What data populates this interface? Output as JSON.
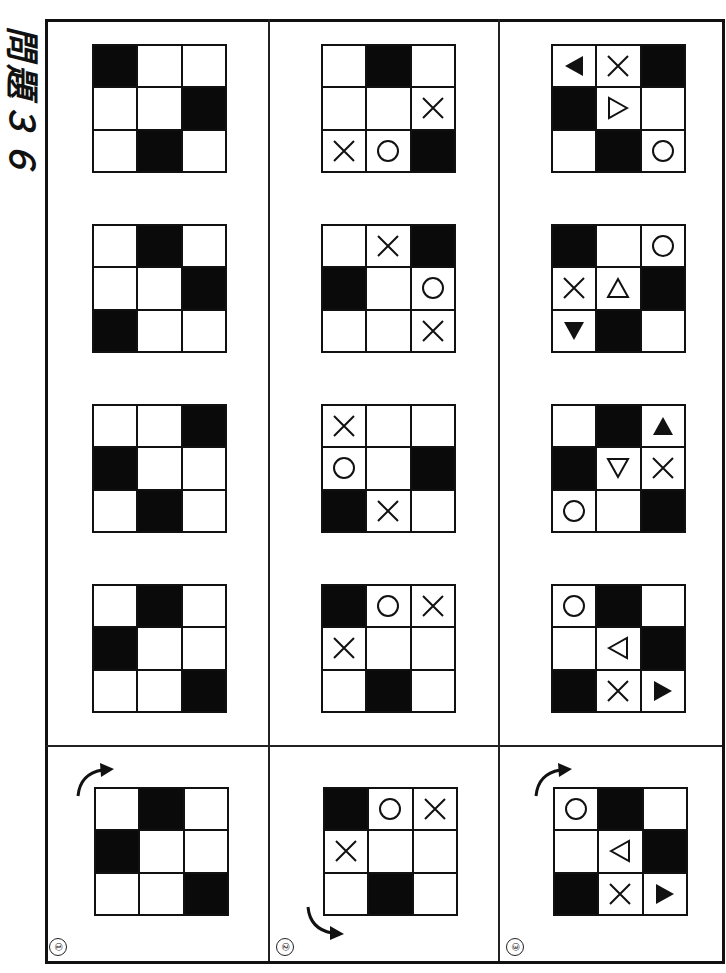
{
  "title": "問題３６",
  "colors": {
    "ink": "#111111",
    "paper": "#ffffff"
  },
  "columns": [
    {
      "label": "①",
      "reference": {
        "rotation_arrow": "clockwise-arrow",
        "cells": [
          "white",
          "black",
          "white",
          "black",
          "white",
          "white",
          "white",
          "white",
          "black"
        ],
        "symbols": [
          "",
          "",
          "",
          "",
          "",
          "",
          "",
          "",
          ""
        ]
      },
      "options": [
        {
          "cells": [
            "black",
            "white",
            "white",
            "white",
            "white",
            "black",
            "white",
            "black",
            "white"
          ],
          "symbols": [
            "",
            "",
            "",
            "",
            "",
            "",
            "",
            "",
            ""
          ]
        },
        {
          "cells": [
            "white",
            "black",
            "white",
            "white",
            "white",
            "black",
            "black",
            "white",
            "white"
          ],
          "symbols": [
            "",
            "",
            "",
            "",
            "",
            "",
            "",
            "",
            ""
          ]
        },
        {
          "cells": [
            "white",
            "white",
            "black",
            "black",
            "white",
            "white",
            "white",
            "black",
            "white"
          ],
          "symbols": [
            "",
            "",
            "",
            "",
            "",
            "",
            "",
            "",
            ""
          ]
        },
        {
          "cells": [
            "white",
            "black",
            "white",
            "black",
            "white",
            "white",
            "white",
            "white",
            "black"
          ],
          "symbols": [
            "",
            "",
            "",
            "",
            "",
            "",
            "",
            "",
            ""
          ]
        }
      ]
    },
    {
      "label": "②",
      "reference": {
        "rotation_arrow": "counterclockwise-arrow",
        "cells": [
          "black",
          "white",
          "white",
          "white",
          "white",
          "white",
          "white",
          "black",
          "white"
        ],
        "symbols": [
          "",
          "circle",
          "cross",
          "cross",
          "",
          "",
          "",
          "",
          ""
        ]
      },
      "options": [
        {
          "cells": [
            "white",
            "black",
            "white",
            "white",
            "white",
            "white",
            "white",
            "white",
            "black"
          ],
          "symbols": [
            "",
            "",
            "",
            "",
            "",
            "cross",
            "cross",
            "circle",
            ""
          ]
        },
        {
          "cells": [
            "white",
            "white",
            "black",
            "black",
            "white",
            "white",
            "white",
            "white",
            "white"
          ],
          "symbols": [
            "",
            "cross",
            "",
            "",
            "",
            "circle",
            "",
            "",
            "cross"
          ]
        },
        {
          "cells": [
            "white",
            "white",
            "white",
            "white",
            "white",
            "black",
            "black",
            "white",
            "white"
          ],
          "symbols": [
            "cross",
            "",
            "",
            "circle",
            "",
            "",
            "",
            "cross",
            ""
          ]
        },
        {
          "cells": [
            "black",
            "white",
            "white",
            "white",
            "white",
            "white",
            "white",
            "black",
            "white"
          ],
          "symbols": [
            "",
            "circle",
            "cross",
            "cross",
            "",
            "",
            "",
            "",
            ""
          ]
        }
      ]
    },
    {
      "label": "③",
      "reference": {
        "rotation_arrow": "clockwise-arrow",
        "cells": [
          "white",
          "black",
          "white",
          "white",
          "white",
          "black",
          "black",
          "white",
          "white"
        ],
        "symbols": [
          "circle",
          "",
          "",
          "",
          "triangle-left-outline",
          "",
          "",
          "cross",
          "triangle-right-filled"
        ]
      },
      "options": [
        {
          "cells": [
            "white",
            "white",
            "black",
            "black",
            "white",
            "white",
            "white",
            "black",
            "white"
          ],
          "symbols": [
            "triangle-left-filled",
            "cross",
            "",
            "",
            "triangle-right-outline",
            "",
            "",
            "",
            "circle"
          ]
        },
        {
          "cells": [
            "black",
            "white",
            "white",
            "white",
            "white",
            "black",
            "white",
            "black",
            "white"
          ],
          "symbols": [
            "",
            "",
            "circle",
            "cross",
            "triangle-up-outline",
            "",
            "triangle-down-filled",
            "",
            ""
          ]
        },
        {
          "cells": [
            "white",
            "black",
            "white",
            "black",
            "white",
            "white",
            "white",
            "white",
            "black"
          ],
          "symbols": [
            "",
            "",
            "triangle-up-filled",
            "",
            "triangle-down-outline",
            "cross",
            "circle",
            "",
            ""
          ]
        },
        {
          "cells": [
            "white",
            "black",
            "white",
            "white",
            "white",
            "black",
            "black",
            "white",
            "white"
          ],
          "symbols": [
            "circle",
            "",
            "",
            "",
            "triangle-left-outline",
            "",
            "",
            "cross",
            "triangle-right-filled"
          ]
        }
      ]
    }
  ]
}
